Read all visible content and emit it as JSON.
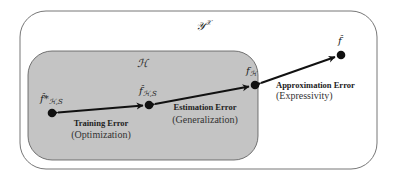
{
  "sets": {
    "outer": {
      "label": "𝒴^𝒳",
      "label_main": "𝒴",
      "label_sup": "𝒳"
    },
    "inner": {
      "label": "ℋ"
    }
  },
  "points": {
    "f_star_HS": {
      "label_main": "f̂*",
      "label_sub": "ℋ,S"
    },
    "f_HS": {
      "label_main": "f̂",
      "label_sub": "ℋ,S"
    },
    "f_H": {
      "label_main": "f",
      "label_sub": "ℋ"
    },
    "f": {
      "label_main": "f̂"
    }
  },
  "errors": {
    "training": {
      "title": "Training Error",
      "subtitle": "(Optimization)"
    },
    "estimation": {
      "title": "Estimation Error",
      "subtitle": "(Generalization)"
    },
    "approximation": {
      "title": "Approximation Error",
      "subtitle": "(Expressivity)"
    }
  },
  "colors": {
    "outer_stroke": "#777777",
    "inner_fill": "#c4c4c4",
    "inner_stroke": "#555555",
    "arrow": "#111111",
    "dot": "#111111"
  }
}
